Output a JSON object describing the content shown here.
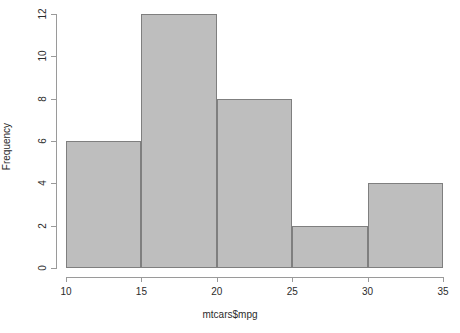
{
  "chart_data": {
    "type": "bar",
    "title": "",
    "subtitle": "",
    "xlabel": "mtcars$mpg",
    "ylabel": "Frequency",
    "categories": [
      "10-15",
      "15-20",
      "20-25",
      "25-30",
      "30-35"
    ],
    "bin_edges": [
      10,
      15,
      20,
      25,
      30,
      35
    ],
    "values": [
      6,
      12,
      8,
      2,
      4
    ],
    "bars": [
      {
        "label": "10-15",
        "x0": 10,
        "x1": 15,
        "value": 6
      },
      {
        "label": "15-20",
        "x0": 15,
        "x1": 20,
        "value": 12
      },
      {
        "label": "20-25",
        "x0": 20,
        "x1": 25,
        "value": 8
      },
      {
        "label": "25-30",
        "x0": 25,
        "x1": 30,
        "value": 2
      },
      {
        "label": "30-35",
        "x0": 30,
        "x1": 35,
        "value": 4
      }
    ],
    "xlim": [
      10,
      35
    ],
    "ylim": [
      0,
      12
    ],
    "xticks": [
      10,
      15,
      20,
      25,
      30,
      35
    ],
    "xtick_labels": [
      "10",
      "15",
      "20",
      "25",
      "30",
      "35"
    ],
    "yticks": [
      0,
      2,
      4,
      6,
      8,
      10,
      12
    ],
    "ytick_labels": [
      "0",
      "2",
      "4",
      "6",
      "8",
      "10",
      "12"
    ],
    "grid": false,
    "legend": false,
    "colors": {
      "bar_fill": "#BEBEBE",
      "bar_border": "#7F7F7F",
      "axis": "#9A9A9A",
      "text": "#2B2B2B",
      "background": "#FFFFFF"
    }
  }
}
